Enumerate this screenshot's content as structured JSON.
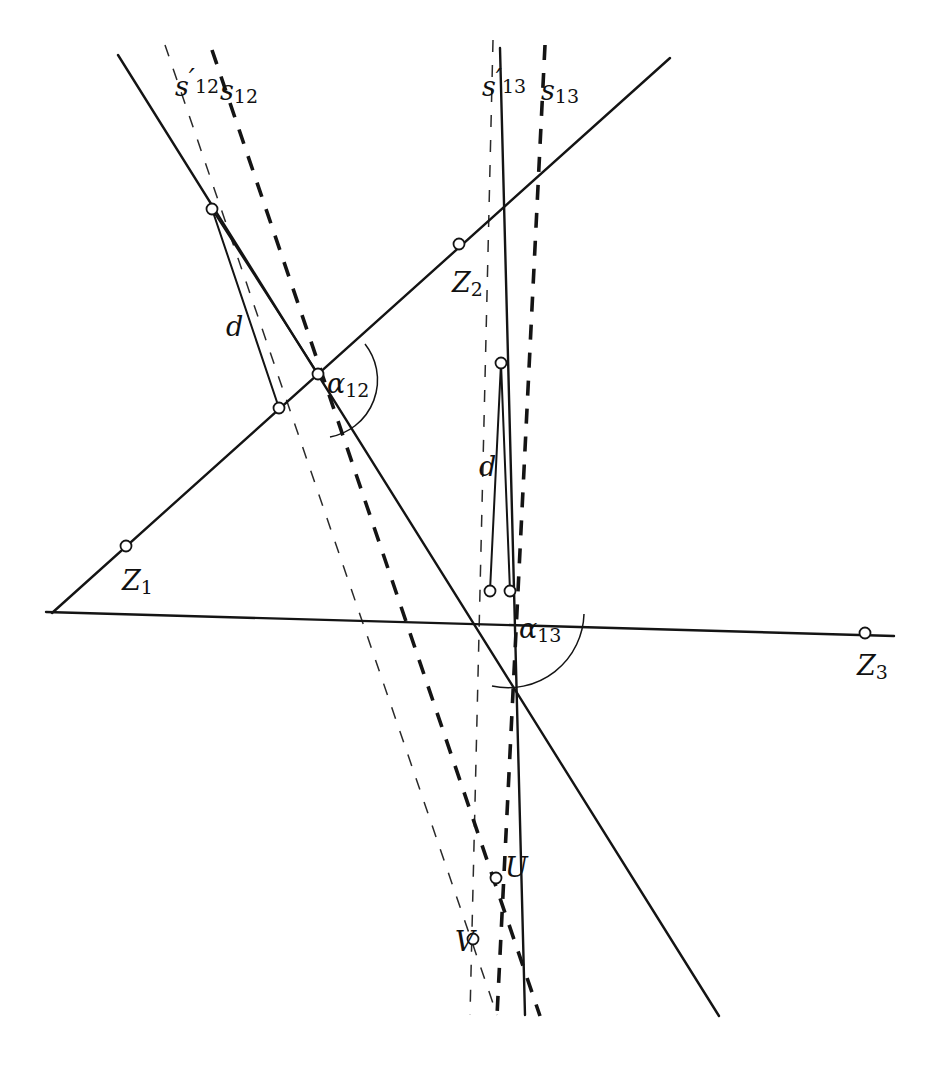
{
  "figure": {
    "background_color": "#ffffff",
    "stroke_color": "#141414",
    "width": 948,
    "height": 1073
  },
  "labels": {
    "s12_prime": {
      "base": "s",
      "prime": "′",
      "sub": "12",
      "x": 175,
      "y": 88
    },
    "s12": {
      "base": "s",
      "prime": "",
      "sub": "12",
      "x": 220,
      "y": 92
    },
    "s13_prime": {
      "base": "s",
      "prime": "′",
      "sub": "13",
      "x": 482,
      "y": 88
    },
    "s13": {
      "base": "s",
      "prime": "",
      "sub": "13",
      "x": 541,
      "y": 92
    },
    "alpha12": {
      "base": "α",
      "sub": "12",
      "x": 327,
      "y": 385
    },
    "alpha13": {
      "base": "α",
      "sub": "13",
      "x": 519,
      "y": 630
    },
    "d_left": {
      "base": "d",
      "x": 226,
      "y": 328
    },
    "d_right": {
      "base": "d",
      "x": 479,
      "y": 468
    },
    "Z1": {
      "base": "Z",
      "sub": "1",
      "x": 122,
      "y": 582
    },
    "Z2": {
      "base": "Z",
      "sub": "2",
      "x": 452,
      "y": 284
    },
    "Z3": {
      "base": "Z",
      "sub": "3",
      "x": 857,
      "y": 667
    },
    "U": {
      "base": "U",
      "x": 505,
      "y": 869
    },
    "V": {
      "base": "V",
      "x": 455,
      "y": 943
    }
  },
  "lines": [
    {
      "name": "line-z1-z2",
      "style": "solid",
      "points": "52,613 670,58"
    },
    {
      "name": "line-z1-z3",
      "style": "solid",
      "points": "46,612 894,636"
    },
    {
      "name": "line-z2-u",
      "style": "solid",
      "points": "118,55 719,1016"
    },
    {
      "name": "line-s13-solid",
      "style": "solid",
      "points": "500,48 525,1015"
    },
    {
      "name": "line-s12-prime-dashed",
      "style": "dashed-thin",
      "points": "165,45 497,1015"
    },
    {
      "name": "line-s12-dashed",
      "style": "dashed-thick",
      "points": "212,50 540,1016"
    },
    {
      "name": "line-s13-prime-dashed",
      "style": "dashed-thin",
      "points": "493,40 470,1015"
    },
    {
      "name": "line-s13-dashed",
      "style": "dashed-thick",
      "points": "545,45 497,1016"
    },
    {
      "name": "triangle-left-edge-a",
      "style": "solid",
      "points": "212,209 279,408"
    },
    {
      "name": "triangle-left-edge-b",
      "style": "solid",
      "points": "212,209 318,374"
    },
    {
      "name": "triangle-right-edge-a",
      "style": "solid",
      "points": "501,363 490,591"
    },
    {
      "name": "triangle-right-edge-b",
      "style": "solid",
      "points": "501,363 510,591"
    }
  ],
  "nodes": [
    {
      "name": "node-apex-left",
      "x": 212,
      "y": 209,
      "r": 5.5
    },
    {
      "name": "node-z2",
      "x": 459,
      "y": 244,
      "r": 5.5
    },
    {
      "name": "node-intersection-alpha12",
      "x": 318,
      "y": 374,
      "r": 5.5
    },
    {
      "name": "node-foot-left",
      "x": 279,
      "y": 408,
      "r": 5.5
    },
    {
      "name": "node-apex-right",
      "x": 501,
      "y": 363,
      "r": 5.5
    },
    {
      "name": "node-z1",
      "x": 126,
      "y": 546,
      "r": 5.5
    },
    {
      "name": "node-foot-right-a",
      "x": 490,
      "y": 591,
      "r": 5.5
    },
    {
      "name": "node-foot-right-b",
      "x": 510,
      "y": 591,
      "r": 5.5
    },
    {
      "name": "node-z3",
      "x": 865,
      "y": 633,
      "r": 5.5
    },
    {
      "name": "node-u",
      "x": 496,
      "y": 878,
      "r": 5.5
    },
    {
      "name": "node-v",
      "x": 473,
      "y": 939,
      "r": 5.5
    }
  ],
  "arcs": [
    {
      "name": "arc-alpha12",
      "path": "M 365,344 A 58 58 0 0 1 330,437"
    },
    {
      "name": "arc-alpha13",
      "path": "M 584,614 A 76 76 0 0 1 492,686"
    }
  ]
}
